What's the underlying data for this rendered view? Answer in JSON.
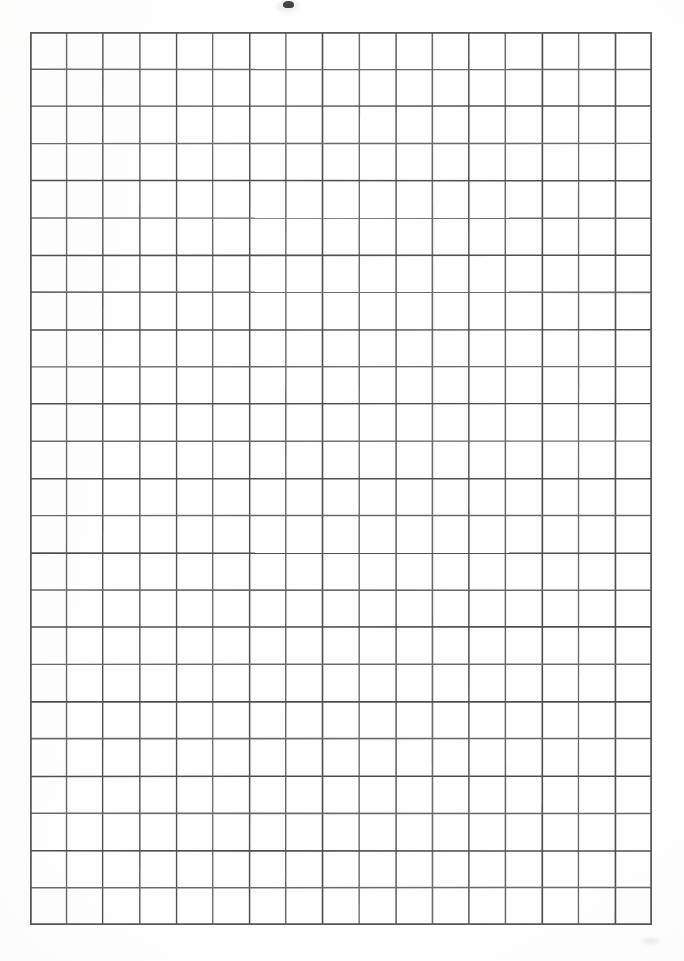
{
  "document": {
    "kind": "scanned-grid-paper",
    "orientation": "portrait",
    "page_width_px": 684,
    "page_height_px": 961,
    "background_color": "#fefefe",
    "caption": ""
  },
  "grid": {
    "label": "",
    "columns": 17,
    "rows": 24,
    "cell_count": 408,
    "origin_x_px": 30,
    "origin_y_px": 32,
    "width_px": 622,
    "height_px": 893,
    "cell_width_px": 36.59,
    "cell_height_px": 37.21,
    "line_color": "#6a6a6a",
    "line_color_dark": "#4f4f4f",
    "border_color": "#5a5a5a",
    "line_width_px": 1.5,
    "border_width_px": 1.8,
    "cells": []
  },
  "artifacts": {
    "top_speck": {
      "name": "scan-speck",
      "x_px": 283,
      "y_px": 1,
      "color": "#2e2e2e"
    },
    "corner_smudge": {
      "name": "corner-smudge",
      "x_px": 640,
      "y_px": 936,
      "color": "#b0b0b0"
    }
  },
  "chart_data": {
    "type": "table",
    "title": "",
    "xlabel": "",
    "ylabel": "",
    "columns": 17,
    "rows": 24,
    "categories": [],
    "values": [],
    "grid": true,
    "legend": false,
    "note": "Blank graph paper: empty 17 x 24 cell ruling, no plotted data, no tick labels."
  }
}
